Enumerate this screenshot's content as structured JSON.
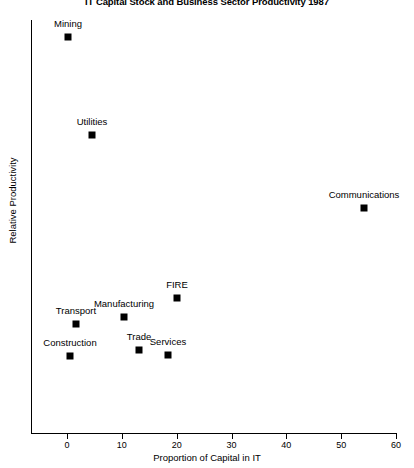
{
  "chart_data": {
    "type": "scatter",
    "title": "IT Capital Stock and Business Sector Productivity 1987",
    "xlabel": "Proportion of Capital in IT",
    "ylabel": "Relative Productivity",
    "xlim": [
      -6,
      60
    ],
    "ylim": [
      0,
      100
    ],
    "xticks": [
      0,
      10,
      20,
      30,
      40,
      50,
      60
    ],
    "xtick_labels": [
      "0",
      "10",
      "20",
      "30",
      "40",
      "50",
      "60"
    ],
    "yticks": [],
    "ytick_labels": [],
    "grid": false,
    "legend": "none",
    "points": [
      {
        "label": "Mining",
        "x": 0.2,
        "y": 95.8,
        "px": 68,
        "py": 37,
        "lx": 68,
        "ly": 29
      },
      {
        "label": "Utilities",
        "x": 4.6,
        "y": 72.0,
        "px": 92,
        "py": 135,
        "lx": 92,
        "ly": 127
      },
      {
        "label": "Communications",
        "x": 54.2,
        "y": 54.4,
        "px": 364,
        "py": 208,
        "lx": 364,
        "ly": 200
      },
      {
        "label": "FIRE",
        "x": 20.0,
        "y": 32.6,
        "px": 177,
        "py": 298,
        "lx": 177,
        "ly": 290
      },
      {
        "label": "Manufacturing",
        "x": 10.4,
        "y": 28.0,
        "px": 124,
        "py": 317,
        "lx": 124,
        "ly": 309
      },
      {
        "label": "Transport",
        "x": 1.5,
        "y": 26.3,
        "px": 76,
        "py": 324,
        "lx": 76,
        "ly": 316
      },
      {
        "label": "Trade",
        "x": 13.1,
        "y": 20.3,
        "px": 139,
        "py": 350,
        "lx": 139,
        "ly": 342
      },
      {
        "label": "Services",
        "x": 18.4,
        "y": 19.1,
        "px": 168,
        "py": 355,
        "lx": 168,
        "ly": 347
      },
      {
        "label": "Construction",
        "x": 0.5,
        "y": 18.9,
        "px": 70,
        "py": 356,
        "lx": 70,
        "ly": 348
      }
    ],
    "axis_geometry": {
      "x_pixel_at_0": 67,
      "x_pixel_at_60": 396,
      "plot_left": 31,
      "plot_top": 20,
      "plot_bottom": 433,
      "plot_right": 396
    },
    "colors": {
      "marker": "#000000",
      "axis": "#000000",
      "text": "#000000",
      "background": "#ffffff"
    }
  }
}
